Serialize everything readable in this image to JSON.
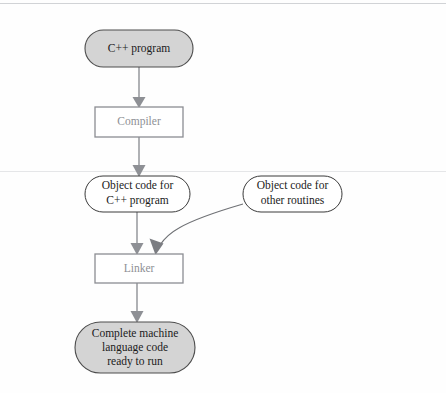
{
  "diagram": {
    "type": "flowchart",
    "orientation": "top-to-bottom",
    "colors": {
      "terminal_fill": "#d4d4d4",
      "terminal_stroke": "#4d4d4d",
      "process_fill": "#ffffff",
      "process_stroke": "#8b8d92",
      "data_fill": "#ffffff",
      "data_stroke": "#3a3a3a",
      "edge": "#8e9095",
      "text_dark": "#1b1b1b",
      "text_gray": "#8e9095",
      "background": "#fefefe"
    },
    "nodes": [
      {
        "id": "cpp-program",
        "shape": "stadium",
        "fill": "gray",
        "lines": [
          "C++ program"
        ]
      },
      {
        "id": "compiler",
        "shape": "rectangle",
        "fill": "white",
        "lines": [
          "Compiler"
        ]
      },
      {
        "id": "object-code-cpp",
        "shape": "stadium",
        "fill": "white",
        "lines": [
          "Object code for",
          "C++ program"
        ]
      },
      {
        "id": "object-code-other",
        "shape": "stadium",
        "fill": "white",
        "lines": [
          "Object code for",
          "other routines"
        ]
      },
      {
        "id": "linker",
        "shape": "rectangle",
        "fill": "white",
        "lines": [
          "Linker"
        ]
      },
      {
        "id": "complete-machine-code",
        "shape": "stadium",
        "fill": "gray",
        "lines": [
          "Complete machine",
          "language code",
          "ready to run"
        ]
      }
    ],
    "edges": [
      {
        "id": "edge-cpp-to-compiler",
        "from": "cpp-program",
        "to": "compiler",
        "style": "straight-arrow",
        "label": ""
      },
      {
        "id": "edge-compiler-to-objcode",
        "from": "compiler",
        "to": "object-code-cpp",
        "style": "straight-arrow",
        "label": ""
      },
      {
        "id": "edge-objcode-to-linker",
        "from": "object-code-cpp",
        "to": "linker",
        "style": "straight-arrow",
        "label": ""
      },
      {
        "id": "edge-other-to-linker",
        "from": "object-code-other",
        "to": "linker",
        "style": "curved-arrow",
        "label": ""
      },
      {
        "id": "edge-linker-to-machine",
        "from": "linker",
        "to": "complete-machine-code",
        "style": "straight-arrow",
        "label": ""
      }
    ]
  }
}
